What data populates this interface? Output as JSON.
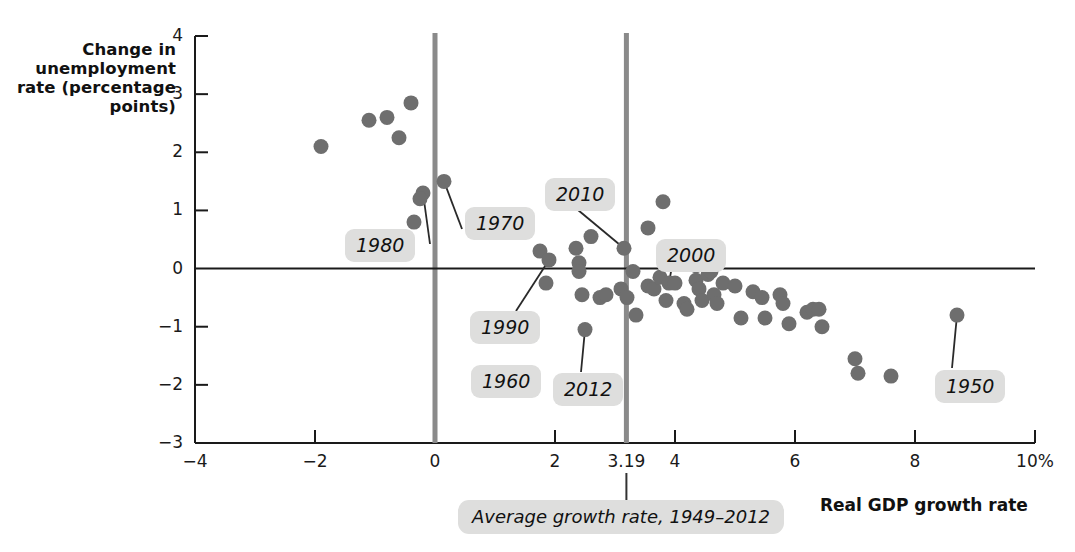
{
  "chart_data": {
    "type": "scatter",
    "title": "",
    "xlabel": "Real GDP growth rate",
    "ylabel": "Change in unemployment rate (percentage points)",
    "xlim": [
      -4,
      10
    ],
    "ylim": [
      -3,
      4
    ],
    "xticks": [
      "-4",
      "-2",
      "0",
      "2",
      "3.19",
      "4",
      "6",
      "8",
      "10%"
    ],
    "xtick_values": [
      -4,
      -2,
      0,
      2,
      3.19,
      4,
      6,
      8,
      10
    ],
    "yticks": [
      "4",
      "3",
      "2",
      "1",
      "0",
      "-1",
      "-2",
      "-3"
    ],
    "ytick_values": [
      4,
      3,
      2,
      1,
      0,
      -1,
      -2,
      -3
    ],
    "grid": false,
    "legend": "none",
    "reference_lines": [
      {
        "name": "zero-growth-line",
        "orientation": "vertical",
        "x": 0,
        "color": "#8a8a8a"
      },
      {
        "name": "average-growth-line",
        "orientation": "vertical",
        "x": 3.19,
        "color": "#8a8a8a"
      },
      {
        "name": "zero-change-line",
        "orientation": "horizontal",
        "y": 0,
        "color": "#1a1a1a"
      }
    ],
    "point_color": "#6e6e6e",
    "points": [
      {
        "x": -1.9,
        "y": 2.1
      },
      {
        "x": -1.1,
        "y": 2.55
      },
      {
        "x": -0.8,
        "y": 2.6
      },
      {
        "x": -0.4,
        "y": 2.85
      },
      {
        "x": -0.6,
        "y": 2.25
      },
      {
        "x": -0.2,
        "y": 1.3,
        "label": "1980"
      },
      {
        "x": -0.25,
        "y": 1.2
      },
      {
        "x": -0.35,
        "y": 0.8
      },
      {
        "x": 0.15,
        "y": 1.5,
        "label": "1970"
      },
      {
        "x": 0.75,
        "y": 0.8
      },
      {
        "x": 1.75,
        "y": 0.3
      },
      {
        "x": 1.9,
        "y": 0.15,
        "label": "1990"
      },
      {
        "x": 1.85,
        "y": -0.25
      },
      {
        "x": 2.35,
        "y": 0.35
      },
      {
        "x": 2.4,
        "y": 0.1
      },
      {
        "x": 2.4,
        "y": -0.05
      },
      {
        "x": 2.45,
        "y": -0.45
      },
      {
        "x": 2.75,
        "y": -0.5
      },
      {
        "x": 2.85,
        "y": -0.45
      },
      {
        "x": 2.6,
        "y": 0.55
      },
      {
        "x": 2.5,
        "y": -1.05,
        "label": "2012"
      },
      {
        "x": 3.1,
        "y": -0.35
      },
      {
        "x": 3.2,
        "y": -0.5
      },
      {
        "x": 3.15,
        "y": 0.35,
        "label": "2010"
      },
      {
        "x": 3.3,
        "y": -0.05
      },
      {
        "x": 3.35,
        "y": -0.8
      },
      {
        "x": 3.55,
        "y": 0.7
      },
      {
        "x": 3.55,
        "y": -0.3
      },
      {
        "x": 3.65,
        "y": -0.35
      },
      {
        "x": 3.8,
        "y": 1.15
      },
      {
        "x": 3.75,
        "y": -0.15
      },
      {
        "x": 3.85,
        "y": -0.55
      },
      {
        "x": 3.9,
        "y": -0.25,
        "label": "2000"
      },
      {
        "x": 4.0,
        "y": -0.25
      },
      {
        "x": 4.15,
        "y": -0.6
      },
      {
        "x": 4.2,
        "y": -0.7
      },
      {
        "x": 4.35,
        "y": 0.05
      },
      {
        "x": 4.35,
        "y": -0.2
      },
      {
        "x": 4.4,
        "y": -0.35
      },
      {
        "x": 4.45,
        "y": -0.55
      },
      {
        "x": 4.55,
        "y": -0.1
      },
      {
        "x": 4.6,
        "y": -0.05
      },
      {
        "x": 4.65,
        "y": -0.45
      },
      {
        "x": 4.7,
        "y": -0.6
      },
      {
        "x": 4.8,
        "y": -0.25
      },
      {
        "x": 5.0,
        "y": -0.3
      },
      {
        "x": 5.1,
        "y": -0.85
      },
      {
        "x": 5.3,
        "y": -0.4
      },
      {
        "x": 5.45,
        "y": -0.5
      },
      {
        "x": 5.5,
        "y": -0.85
      },
      {
        "x": 5.75,
        "y": -0.45
      },
      {
        "x": 5.8,
        "y": -0.6
      },
      {
        "x": 5.9,
        "y": -0.95
      },
      {
        "x": 6.2,
        "y": -0.75
      },
      {
        "x": 6.3,
        "y": -0.7
      },
      {
        "x": 6.4,
        "y": -0.7
      },
      {
        "x": 6.45,
        "y": -1.0
      },
      {
        "x": 7.0,
        "y": -1.55
      },
      {
        "x": 7.05,
        "y": -1.8
      },
      {
        "x": 7.6,
        "y": -1.85
      },
      {
        "x": 8.7,
        "y": -0.8,
        "label": "1950"
      }
    ],
    "annotations": [
      {
        "name": "callout-1980",
        "text": "1980",
        "x_px": 345,
        "y_px": 229
      },
      {
        "name": "callout-1970",
        "text": "1970",
        "x_px": 465,
        "y_px": 207
      },
      {
        "name": "callout-2010",
        "text": "2010",
        "x_px": 545,
        "y_px": 178
      },
      {
        "name": "callout-2000",
        "text": "2000",
        "x_px": 656,
        "y_px": 239
      },
      {
        "name": "callout-1990",
        "text": "1990",
        "x_px": 470,
        "y_px": 311
      },
      {
        "name": "callout-1960",
        "text": "1960",
        "x_px": 471,
        "y_px": 365
      },
      {
        "name": "callout-2012",
        "text": "2012",
        "x_px": 553,
        "y_px": 373
      },
      {
        "name": "callout-1950",
        "text": "1950",
        "x_px": 935,
        "y_px": 370
      }
    ],
    "average_growth_note": "Average growth rate, 1949–2012",
    "average_growth_value": 3.19
  },
  "axes": {
    "y_title": "Change in\nunemployment\nrate (percentage\npoints)",
    "y_title_lines": [
      "Change in",
      "unemployment",
      "rate (percentage",
      "points)"
    ],
    "x_title": "Real GDP growth rate"
  }
}
